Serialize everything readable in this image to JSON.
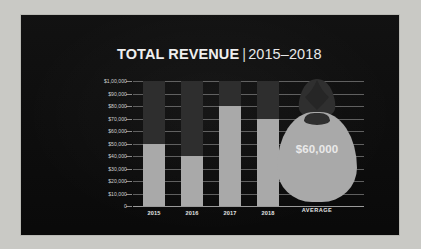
{
  "chart_data": {
    "type": "bar",
    "title_main": "TOTAL REVENUE",
    "title_separator": "|",
    "title_years": "2015–2018",
    "categories": [
      "2015",
      "2016",
      "2017",
      "2018"
    ],
    "values": [
      50000,
      40000,
      80000,
      70000
    ],
    "series": [
      {
        "name": "Total Revenue",
        "values": [
          50000,
          40000,
          80000,
          70000
        ]
      }
    ],
    "xlabel": "",
    "ylabel": "",
    "ylim": [
      0,
      100000
    ],
    "ytick_values": [
      100000,
      90000,
      80000,
      70000,
      60000,
      50000,
      40000,
      30000,
      20000,
      10000,
      0
    ],
    "ytick_labels": [
      "$1,00,000",
      "$90,000",
      "$80,000",
      "$70,000",
      "$60,000",
      "$50,000",
      "$40,000",
      "$30,000",
      "$20,000",
      "$10,000",
      "0"
    ],
    "grid": true,
    "legend": "none",
    "annotations": [
      {
        "name": "average-bag",
        "label": "AVERAGE",
        "value": 60000,
        "value_label": "$60,000"
      }
    ],
    "colors": {
      "background": "#0d0d0d",
      "bar_fill": "#a9a9a9",
      "bar_track": "#2e2e2e",
      "gridline": "#6f6f6f",
      "axis": "#9a9a9a",
      "text": "#e2e2e2",
      "title_text": "#efefef",
      "frame": "#c9c9c5"
    }
  },
  "average": {
    "label": "AVERAGE",
    "value_label": "$60,000"
  },
  "icons": {
    "money_bag": "money-bag-icon"
  }
}
